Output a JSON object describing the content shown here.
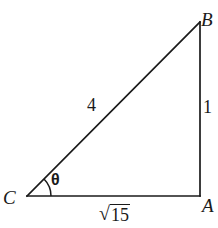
{
  "figure": {
    "type": "right-triangle-geometry-diagram",
    "background_color": "#ffffff",
    "stroke_color": "#1a1a1a",
    "vertices": {
      "a": {
        "label": "A",
        "x": 200,
        "y": 196
      },
      "b": {
        "label": "B",
        "x": 200,
        "y": 22
      },
      "c": {
        "label": "C",
        "x": 27,
        "y": 196
      }
    },
    "sides": {
      "hypotenuse": {
        "label": "4",
        "from": "C",
        "to": "B"
      },
      "opposite": {
        "label": "1",
        "from": "A",
        "to": "B"
      },
      "adjacent": {
        "radical": "√",
        "radicand": "15",
        "label": "√15",
        "from": "C",
        "to": "A"
      }
    },
    "angle": {
      "label": "θ",
      "at_vertex": "C",
      "arc_radius": 24
    }
  }
}
